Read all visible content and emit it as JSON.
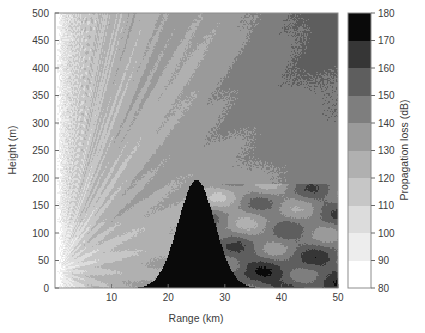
{
  "figure": {
    "background_color": "#ffffff",
    "axes_border_color": "#8c8c8c",
    "text_color": "#3c3c3c"
  },
  "chart_data": {
    "type": "heatmap",
    "title": "",
    "xlabel": "Range (km)",
    "ylabel": "Height (m)",
    "xlim": [
      0,
      50
    ],
    "ylim": [
      0,
      500
    ],
    "xticks": [
      10,
      20,
      30,
      40,
      50
    ],
    "xtick_labels": [
      "10",
      "20",
      "30",
      "40",
      "50"
    ],
    "yticks": [
      0,
      50,
      100,
      150,
      200,
      250,
      300,
      350,
      400,
      450,
      500
    ],
    "ytick_labels": [
      "0",
      "50",
      "100",
      "150",
      "200",
      "250",
      "300",
      "350",
      "400",
      "450",
      "500"
    ],
    "grid": false,
    "legend_position": "right-colorbar",
    "colorbar": {
      "label": "Propagation loss (dB)",
      "min": 80,
      "max": 180,
      "step": 10,
      "tick_values": [
        80,
        90,
        100,
        110,
        120,
        130,
        140,
        150,
        160,
        170,
        180
      ],
      "tick_labels": [
        "80",
        "90",
        "100",
        "110",
        "120",
        "130",
        "140",
        "150",
        "160",
        "170",
        "180"
      ],
      "bands": [
        {
          "from": 80,
          "to": 90,
          "color": "#ffffff"
        },
        {
          "from": 90,
          "to": 100,
          "color": "#ededed"
        },
        {
          "from": 100,
          "to": 110,
          "color": "#dcdcdc"
        },
        {
          "from": 110,
          "to": 120,
          "color": "#c6c6c6"
        },
        {
          "from": 120,
          "to": 130,
          "color": "#b0b0b0"
        },
        {
          "from": 130,
          "to": 140,
          "color": "#9a9a9a"
        },
        {
          "from": 140,
          "to": 150,
          "color": "#7e7e7e"
        },
        {
          "from": 150,
          "to": 160,
          "color": "#5e5e5e"
        },
        {
          "from": 160,
          "to": 170,
          "color": "#363636"
        },
        {
          "from": 170,
          "to": 180,
          "color": "#0a0a0a"
        }
      ]
    },
    "features": {
      "source_height_m": 30,
      "obstruction_peak_range_km": 25,
      "obstruction_peak_height_m": 196,
      "shadow_zone_loss_db": 170,
      "near_field_loss_db": 85,
      "description": "Radio propagation loss over a terrain obstruction with interference lobes above and a deep shadow region behind the peak"
    },
    "lobes": [
      {
        "angle_deg": 2.0,
        "loss_db": 95
      },
      {
        "angle_deg": 3.4,
        "loss_db": 100
      },
      {
        "angle_deg": 4.8,
        "loss_db": 98
      },
      {
        "angle_deg": 6.4,
        "loss_db": 103
      },
      {
        "angle_deg": 8.2,
        "loss_db": 100
      },
      {
        "angle_deg": 10.5,
        "loss_db": 105
      },
      {
        "angle_deg": 13.0,
        "loss_db": 102
      },
      {
        "angle_deg": 16.0,
        "loss_db": 108
      },
      {
        "angle_deg": 19.5,
        "loss_db": 104
      },
      {
        "angle_deg": 24.0,
        "loss_db": 110
      }
    ],
    "far_field_bands": [
      {
        "range_km": 30,
        "height_m": 250,
        "loss_db": 115
      },
      {
        "range_km": 36,
        "height_m": 300,
        "loss_db": 120
      },
      {
        "range_km": 42,
        "height_m": 200,
        "loss_db": 130
      },
      {
        "range_km": 46,
        "height_m": 120,
        "loss_db": 145
      },
      {
        "range_km": 48,
        "height_m": 40,
        "loss_db": 158
      }
    ]
  }
}
